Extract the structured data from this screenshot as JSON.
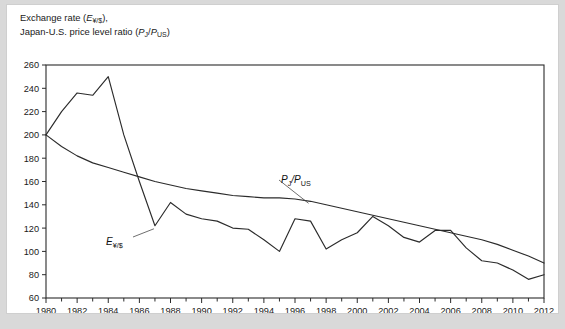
{
  "figure": {
    "axis_title_line1": "Exchange rate (E¥/$),",
    "axis_title_line2": "Japan-U.S. price level ratio (PJ/PUS)",
    "background_color": "#d9d9d9",
    "panel_color": "#ffffff",
    "line_color": "#2b2b2b"
  },
  "annotations": {
    "exchange_rate_label": "E¥/$",
    "price_ratio_label": "PJ/PUS"
  },
  "chart_data": {
    "type": "line",
    "title": "Exchange rate (E¥/$), Japan-U.S. price level ratio (PJ/PUS)",
    "xlabel": "",
    "ylabel": "Exchange rate (E¥/$), Japan-U.S. price level ratio (PJ/PUS)",
    "xlim": [
      1980,
      2012
    ],
    "ylim": [
      60,
      260
    ],
    "ytick_step": 20,
    "xtick_step": 2,
    "xtick_minor_step": 1,
    "grid": false,
    "legend": "inline-labels",
    "yticks": [
      60,
      80,
      100,
      120,
      140,
      160,
      180,
      200,
      220,
      240,
      260
    ],
    "xticks": [
      1980,
      1982,
      1984,
      1986,
      1988,
      1990,
      1992,
      1994,
      1996,
      1998,
      2000,
      2002,
      2004,
      2006,
      2008,
      2010,
      2012
    ],
    "x": [
      1980,
      1981,
      1982,
      1983,
      1984,
      1985,
      1986,
      1987,
      1988,
      1989,
      1990,
      1991,
      1992,
      1993,
      1994,
      1995,
      1996,
      1997,
      1998,
      1999,
      2000,
      2001,
      2002,
      2003,
      2004,
      2005,
      2006,
      2007,
      2008,
      2009,
      2010,
      2011,
      2012
    ],
    "series": [
      {
        "name": "E¥/$",
        "label": "E¥/$",
        "values": [
          200,
          220,
          236,
          234,
          250,
          200,
          160,
          122,
          142,
          132,
          128,
          126,
          120,
          119,
          110,
          100,
          128,
          126,
          102,
          110,
          116,
          130,
          122,
          112,
          108,
          118,
          118,
          103,
          92,
          90,
          84,
          76,
          80
        ]
      },
      {
        "name": "PJ/PUS",
        "label": "PJ/PUS",
        "values": [
          200,
          190,
          182,
          176,
          172,
          168,
          164,
          160,
          157,
          154,
          152,
          150,
          148,
          147,
          146,
          146,
          145,
          143,
          140,
          137,
          134,
          131,
          128,
          125,
          122,
          119,
          116,
          113,
          110,
          106,
          101,
          96,
          90
        ]
      }
    ]
  }
}
